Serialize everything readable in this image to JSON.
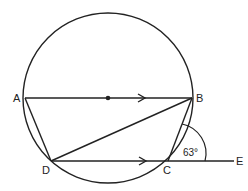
{
  "diagram": {
    "points": {
      "A": {
        "label": "A",
        "x": 25,
        "y": 98
      },
      "B": {
        "label": "B",
        "x": 192,
        "y": 98
      },
      "C": {
        "label": "C",
        "x": 168,
        "y": 161
      },
      "D": {
        "label": "D",
        "x": 51,
        "y": 161
      },
      "E": {
        "label": "E",
        "x": 232,
        "y": 161
      }
    },
    "circle": {
      "cx": 108,
      "cy": 98,
      "r": 84
    },
    "center_label": "",
    "angle_label": "63°",
    "segments": [
      "AB",
      "AD",
      "DB",
      "DC",
      "CB",
      "CE"
    ],
    "parallel_marks": [
      "AB",
      "DC"
    ],
    "colors": {
      "stroke": "#222222",
      "background": "#ffffff"
    }
  }
}
